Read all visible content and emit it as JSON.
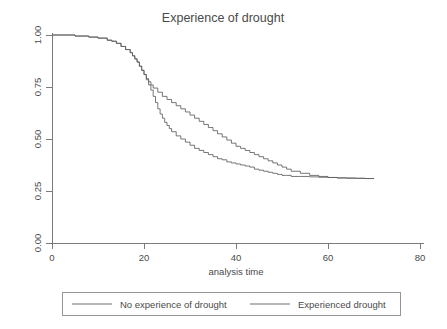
{
  "chart_data": {
    "type": "line",
    "title": "Experience of drought",
    "xlabel": "analysis time",
    "ylabel": "",
    "xlim": [
      0,
      80
    ],
    "ylim": [
      0,
      1.0
    ],
    "xticks": [
      "0",
      "20",
      "40",
      "60",
      "80"
    ],
    "xtick_values": [
      0,
      20,
      40,
      60,
      80
    ],
    "yticks": [
      "0.00",
      "0.25",
      "0.50",
      "0.75",
      "1.00"
    ],
    "ytick_values": [
      0.0,
      0.25,
      0.5,
      0.75,
      1.0
    ],
    "grid": false,
    "legend_position": "bottom",
    "step_style": "post",
    "line_color": "#5e5e5e",
    "background_color": "#ffffff",
    "series": [
      {
        "name": "No experience of drought",
        "x": [
          0,
          2,
          5,
          8,
          10,
          12,
          13,
          14,
          15,
          16,
          17,
          17.5,
          18,
          18.5,
          19,
          19.5,
          20,
          20.5,
          21,
          21.5,
          22,
          22.5,
          23,
          23.5,
          24,
          24.5,
          25,
          25.5,
          26,
          27,
          28,
          29,
          30,
          31,
          32,
          33,
          34,
          35,
          36,
          37,
          38,
          39,
          40,
          41,
          42,
          43,
          44,
          45,
          46,
          47,
          48,
          49,
          50,
          51,
          52,
          54,
          56,
          58,
          60,
          62,
          64,
          66,
          68,
          70
        ],
        "y": [
          1.0,
          1.0,
          0.995,
          0.99,
          0.985,
          0.975,
          0.97,
          0.96,
          0.945,
          0.93,
          0.915,
          0.9,
          0.885,
          0.87,
          0.85,
          0.83,
          0.81,
          0.785,
          0.76,
          0.735,
          0.705,
          0.675,
          0.645,
          0.62,
          0.6,
          0.58,
          0.565,
          0.55,
          0.535,
          0.515,
          0.5,
          0.485,
          0.47,
          0.455,
          0.445,
          0.435,
          0.425,
          0.415,
          0.405,
          0.4,
          0.39,
          0.385,
          0.38,
          0.375,
          0.37,
          0.365,
          0.355,
          0.35,
          0.345,
          0.34,
          0.335,
          0.33,
          0.325,
          0.325,
          0.32,
          0.32,
          0.318,
          0.316,
          0.315,
          0.313,
          0.312,
          0.311,
          0.31,
          0.31
        ]
      },
      {
        "name": "Experienced drought",
        "x": [
          0,
          2,
          5,
          8,
          10,
          12,
          13,
          14,
          15,
          16,
          17,
          17.5,
          18,
          18.5,
          19,
          19.5,
          20,
          20.5,
          21,
          21.5,
          22,
          23,
          24,
          25,
          26,
          27,
          28,
          29,
          30,
          31,
          32,
          33,
          34,
          35,
          36,
          37,
          38,
          39,
          40,
          41,
          42,
          43,
          44,
          45,
          46,
          47,
          48,
          49,
          50,
          51,
          52,
          54,
          56,
          58,
          60,
          62,
          64,
          66,
          68,
          70
        ],
        "y": [
          1.0,
          1.0,
          0.995,
          0.99,
          0.985,
          0.975,
          0.97,
          0.96,
          0.945,
          0.93,
          0.915,
          0.9,
          0.885,
          0.87,
          0.85,
          0.83,
          0.81,
          0.79,
          0.775,
          0.76,
          0.745,
          0.725,
          0.705,
          0.69,
          0.675,
          0.66,
          0.645,
          0.63,
          0.615,
          0.6,
          0.585,
          0.57,
          0.555,
          0.54,
          0.525,
          0.51,
          0.495,
          0.48,
          0.465,
          0.455,
          0.445,
          0.435,
          0.425,
          0.415,
          0.405,
          0.395,
          0.385,
          0.375,
          0.365,
          0.355,
          0.345,
          0.335,
          0.325,
          0.32,
          0.315,
          0.313,
          0.312,
          0.311,
          0.31,
          0.31
        ]
      }
    ],
    "annotations": []
  },
  "legend": {
    "entries": [
      {
        "label": "No experience of drought"
      },
      {
        "label": "Experienced drought"
      }
    ]
  }
}
